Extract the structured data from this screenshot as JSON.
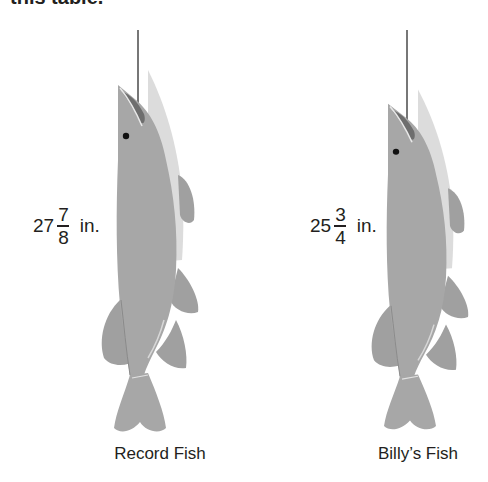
{
  "header": {
    "cut_text": "this table."
  },
  "fish": [
    {
      "name": "Record Fish",
      "length": {
        "whole": "27",
        "numerator": "7",
        "denominator": "8",
        "unit": "in."
      }
    },
    {
      "name": "Billy’s Fish",
      "length": {
        "whole": "25",
        "numerator": "3",
        "denominator": "4",
        "unit": "in."
      }
    }
  ],
  "colors": {
    "body": "#a7a7a7",
    "back": "#dcdcdc",
    "fin": "#a0a0a0",
    "mouth": "#6e6e6e",
    "line": "#555555",
    "eye": "#111111",
    "text": "#231f20"
  }
}
